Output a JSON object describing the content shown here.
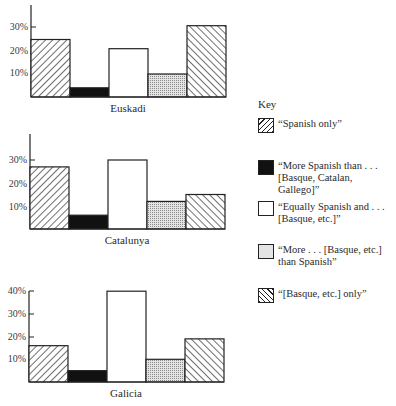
{
  "chart_data": [
    {
      "type": "bar",
      "title": "",
      "xlabel": "Euskadi",
      "ylabel": "",
      "ylim": [
        0,
        40
      ],
      "yticks": [
        "10%",
        "20%",
        "30%"
      ],
      "grid": false,
      "categories": [
        "“Spanish only”",
        "“More Spanish than . . . [Basque, Catalan, Gallego]”",
        "“Equally Spanish and . . . [Basque, etc.]”",
        "“More . . . [Basque, etc.] than Spanish”",
        "“[Basque, etc.] only”"
      ],
      "values": [
        25,
        4,
        21,
        10,
        31
      ]
    },
    {
      "type": "bar",
      "title": "",
      "xlabel": "Catalunya",
      "ylabel": "",
      "ylim": [
        0,
        40
      ],
      "yticks": [
        "10%",
        "20%",
        "30%"
      ],
      "grid": false,
      "categories": [
        "“Spanish only”",
        "“More Spanish than . . . [Basque, Catalan, Gallego]”",
        "“Equally Spanish and . . . [Basque, etc.]”",
        "“More . . . [Basque, etc.] than Spanish”",
        "“[Basque, etc.] only”"
      ],
      "values": [
        27,
        6,
        30,
        12,
        15
      ]
    },
    {
      "type": "bar",
      "title": "",
      "xlabel": "Galicia",
      "ylabel": "",
      "ylim": [
        0,
        40
      ],
      "yticks": [
        "10%",
        "20%",
        "30%",
        "40%"
      ],
      "grid": false,
      "categories": [
        "“Spanish only”",
        "“More Spanish than . . . [Basque, Catalan, Gallego]”",
        "“Equally Spanish and . . . [Basque, etc.]”",
        "“More . . . [Basque, etc.] than Spanish”",
        "“[Basque, etc.] only”"
      ],
      "values": [
        16,
        5,
        40,
        10,
        19
      ]
    }
  ],
  "panels": [
    {
      "label": "Euskadi",
      "ticks": [
        "30%",
        "20%",
        "10%"
      ]
    },
    {
      "label": "Catalunya",
      "ticks": [
        "30%",
        "20%",
        "10%"
      ]
    },
    {
      "label": "Galicia",
      "ticks": [
        "40%",
        "30%",
        "20%",
        "10%"
      ]
    }
  ],
  "key": {
    "title": "Key",
    "items": [
      {
        "pattern": "hatch-forward",
        "label": "“Spanish only”"
      },
      {
        "pattern": "solid-black",
        "label": "“More Spanish than . . . [Basque, Catalan, Gallego]”"
      },
      {
        "pattern": "white",
        "label": "“Equally Spanish and . . . [Basque, etc.]”"
      },
      {
        "pattern": "dotted",
        "label": "“More . . . [Basque, etc.] than Spanish”"
      },
      {
        "pattern": "hatch-back",
        "label": "“[Basque, etc.] only”"
      }
    ]
  },
  "colors": {
    "ink": "#1a1a1a",
    "dots": "#9a9a9a",
    "paper": "#ffffff"
  }
}
